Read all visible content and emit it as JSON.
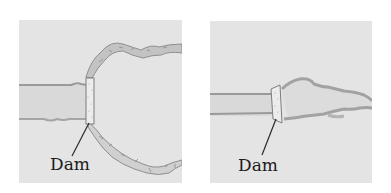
{
  "colors": {
    "background": "#ffffff",
    "panel_fill": "#e4e4e4",
    "water_fill": "#d9d9d9",
    "bank_stroke": "#9a9a9a",
    "bank_shadow": "#b4b4b4",
    "dam_fill": "#ececec",
    "dam_stroke": "#7d7d7d",
    "rock_fill": "#cfcfcf",
    "rock_stroke": "#8a8a8a",
    "leader_line": "#2a2a2a",
    "label_text": "#1c1c1c"
  },
  "panels": [
    {
      "id": "left",
      "description": "River dammed with large reservoir basin bounded by rocky shoreline",
      "label": "Dam"
    },
    {
      "id": "right",
      "description": "River dammed with narrow reservoir extending upstream",
      "label": "Dam"
    }
  ]
}
